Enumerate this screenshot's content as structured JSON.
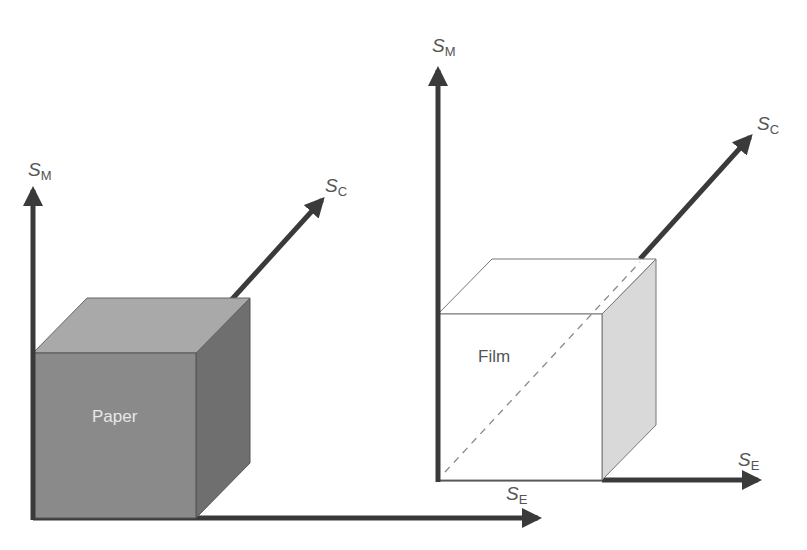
{
  "diagram": {
    "left": {
      "cube_label": "Paper",
      "axes": {
        "vertical": {
          "main": "S",
          "sub": "M"
        },
        "diagonal": {
          "main": "S",
          "sub": "C"
        },
        "horizontal": {
          "main": "S",
          "sub": "E"
        }
      },
      "colors": {
        "front": "#8a8a8a",
        "top": "#a9a9a9",
        "side": "#6f6f6f",
        "label": "#e8e8e8"
      }
    },
    "right": {
      "cube_label": "Film",
      "axes": {
        "vertical": {
          "main": "S",
          "sub": "M"
        },
        "diagonal": {
          "main": "S",
          "sub": "C"
        },
        "horizontal": {
          "main": "S",
          "sub": "E"
        }
      },
      "colors": {
        "front": "#ffffff",
        "top": "#ffffff",
        "side": "#d9d9d9",
        "label": "#555555"
      }
    },
    "axis_color": "#3a3a3a"
  }
}
